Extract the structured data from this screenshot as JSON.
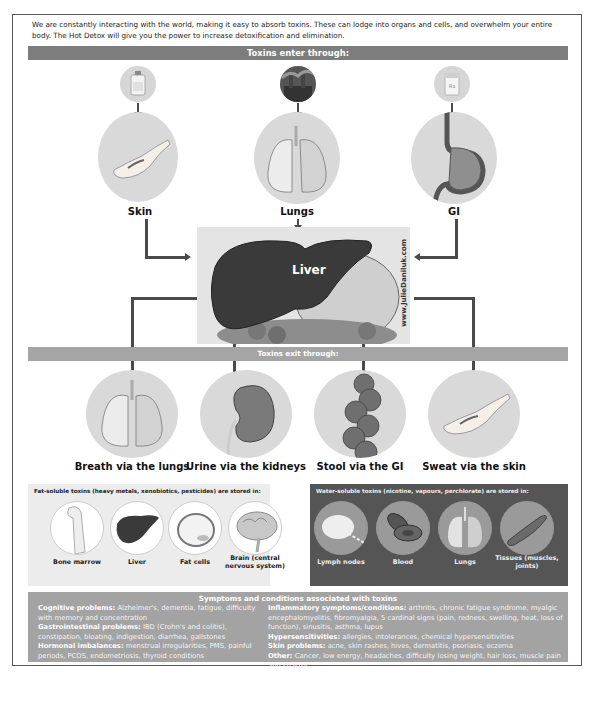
{
  "intro": {
    "text": "We are constantly interacting with the world, making it easy to absorb toxins. These can lodge into organs and cells, and overwhelm your entire body. The Hot Detox will give you the power to increase detoxification and elimination."
  },
  "enter": {
    "title": "Toxins enter through:",
    "routes": [
      {
        "label": "Skin",
        "source_icon": "bottle-icon",
        "organ_icon": "hand-icon"
      },
      {
        "label": "Lungs",
        "source_icon": "factory-smoke-icon",
        "organ_icon": "lungs-icon"
      },
      {
        "label": "GI",
        "source_icon": "pill-bottle-icon",
        "organ_icon": "stomach-icon"
      }
    ]
  },
  "liver": {
    "label": "Liver",
    "watermark": "www.JulieDaniluk.com"
  },
  "exit": {
    "title": "Toxins exit through:",
    "routes": [
      {
        "label": "Breath via the lungs",
        "icon": "lungs-icon"
      },
      {
        "label": "Urine via the kidneys",
        "icon": "kidney-icon"
      },
      {
        "label": "Stool via the GI",
        "icon": "colon-icon"
      },
      {
        "label": "Sweat via the skin",
        "icon": "hand-icon"
      }
    ]
  },
  "fat_soluble": {
    "title": "Fat-soluble toxins (heavy metals, xenobiotics, pesticides) are stored in:",
    "items": [
      {
        "label": "Bone marrow",
        "icon": "bone-icon"
      },
      {
        "label": "Liver",
        "icon": "liver-icon"
      },
      {
        "label": "Fat cells",
        "icon": "fat-cell-icon"
      },
      {
        "label": "Brain (central nervous system)",
        "icon": "brain-icon"
      }
    ]
  },
  "water_soluble": {
    "title": "Water-soluble toxins (nicotine, vapours, perchlorate) are stored in:",
    "items": [
      {
        "label": "Lymph nodes",
        "icon": "lymph-node-icon"
      },
      {
        "label": "Blood",
        "icon": "blood-cell-icon"
      },
      {
        "label": "Lungs",
        "icon": "lungs-icon"
      },
      {
        "label": "Tissues (muscles, joints)",
        "icon": "muscle-icon"
      }
    ]
  },
  "symptoms": {
    "title": "Symptoms and conditions associated with toxins",
    "left": [
      {
        "heading": "Cognitive problems:",
        "text": " Alzheimer's, dementia, fatigue, difficulty with memory and concentration"
      },
      {
        "heading": "Gastrointestinal problems:",
        "text": " IBD (Crohn's and colitis), constipation, bloating, indigestion, diarrhea, gallstones"
      },
      {
        "heading": "Hormonal imbalances:",
        "text": " menstrual irregularities, PMS, painful periods, PCOS, endometriosis, thyroid conditions"
      }
    ],
    "right": [
      {
        "heading": "Inflammatory symptoms/conditions:",
        "text": " arthritis, chronic fatigue syndrome, myalgic encephalomyelitis, fibromyalgia, 5 cardinal signs (pain, redness, swelling, heat, loss of function), sinusitis, asthma, lupus"
      },
      {
        "heading": "Hypersensitivities:",
        "text": " allergies, intolerances, chemical hypersensitivities"
      },
      {
        "heading": "Skin problems:",
        "text": " acne, skin rashes, hives, dermatitis, psoriasis, eczema"
      },
      {
        "heading": "Other:",
        "text": " Cancer, low energy, headaches, difficulty losing weight, hair loss, muscle pain and spasms"
      }
    ]
  },
  "colors": {
    "enter_bar": "#7d7d7d",
    "exit_bar": "#a5a5a5",
    "water_panel": "#555555",
    "fat_panel": "#ececec",
    "symptoms_panel": "#a3a3a3",
    "arrow": "#4a4a4a"
  }
}
